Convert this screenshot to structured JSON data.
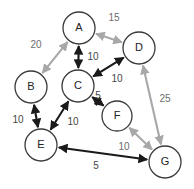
{
  "diagram": {
    "width": 194,
    "height": 189,
    "background": "#ffffff",
    "colors": {
      "dark_edge": "#1a1a1a",
      "light_edge": "#a8a8a8",
      "node_stroke": "#3a3a3a",
      "node_fill": "#ffffff",
      "node_text": "#222222",
      "label_text": "#454545"
    },
    "nodes": [
      {
        "id": "A",
        "label": "A",
        "cx": 79,
        "cy": 28,
        "r": 16
      },
      {
        "id": "B",
        "label": "B",
        "cx": 31,
        "cy": 87,
        "r": 16
      },
      {
        "id": "C",
        "label": "C",
        "cx": 78,
        "cy": 86,
        "r": 16
      },
      {
        "id": "D",
        "label": "D",
        "cx": 139,
        "cy": 48,
        "r": 16
      },
      {
        "id": "E",
        "label": "E",
        "cx": 41,
        "cy": 145,
        "r": 16
      },
      {
        "id": "F",
        "label": "F",
        "cx": 117,
        "cy": 116,
        "r": 15
      },
      {
        "id": "G",
        "label": "G",
        "cx": 165,
        "cy": 162,
        "r": 16
      }
    ],
    "edges": [
      {
        "from": "A",
        "to": "B",
        "weight": "20",
        "style": "light",
        "arrows": "both",
        "label_x": 36,
        "label_y": 45
      },
      {
        "from": "A",
        "to": "D",
        "weight": "15",
        "style": "light",
        "arrows": "both",
        "label_x": 114,
        "label_y": 18
      },
      {
        "from": "A",
        "to": "C",
        "weight": "10",
        "style": "dark",
        "arrows": "both",
        "label_x": 93,
        "label_y": 57
      },
      {
        "from": "C",
        "to": "D",
        "weight": "10",
        "style": "dark",
        "arrows": "both",
        "label_x": 117,
        "label_y": 79
      },
      {
        "from": "C",
        "to": "F",
        "weight": "5",
        "style": "dark",
        "arrows": "both",
        "label_x": 98,
        "label_y": 96
      },
      {
        "from": "B",
        "to": "E",
        "weight": "10",
        "style": "dark",
        "arrows": "both",
        "label_x": 18,
        "label_y": 120
      },
      {
        "from": "C",
        "to": "E",
        "weight": "10",
        "style": "dark",
        "arrows": "both",
        "label_x": 73,
        "label_y": 122
      },
      {
        "from": "D",
        "to": "G",
        "weight": "25",
        "style": "light",
        "arrows": "both",
        "label_x": 165,
        "label_y": 99
      },
      {
        "from": "F",
        "to": "G",
        "weight": "10",
        "style": "light",
        "arrows": "both",
        "label_x": 124,
        "label_y": 147
      },
      {
        "from": "E",
        "to": "G",
        "weight": "5",
        "style": "dark",
        "arrows": "both",
        "label_x": 96,
        "label_y": 166
      }
    ]
  }
}
